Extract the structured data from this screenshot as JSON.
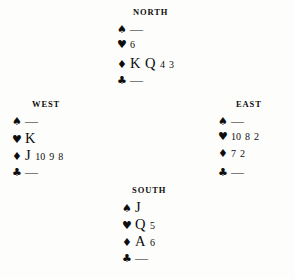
{
  "diagram": {
    "type": "bridge-hand-diagram",
    "background_color": "#fdfdfc",
    "ink_color": "#0d0d0d",
    "suits": {
      "spade": "♠",
      "heart": "♥",
      "diamond": "♦",
      "club": "♣"
    },
    "void_mark": "—"
  },
  "hands": {
    "north": {
      "label": "NORTH",
      "spades": "—",
      "hearts": "6",
      "diamonds": "K Q 4 3",
      "clubs": "—",
      "spade_cards": [
        "—"
      ],
      "heart_cards": [
        "6"
      ],
      "diamond_cards": [
        "K",
        "Q",
        "4",
        "3"
      ],
      "club_cards": [
        "—"
      ]
    },
    "west": {
      "label": "WEST",
      "spades": "—",
      "hearts": "K",
      "diamonds": "J 10 9 8",
      "clubs": "—",
      "spade_cards": [
        "—"
      ],
      "heart_cards": [
        "K"
      ],
      "diamond_cards": [
        "J",
        "10",
        "9",
        "8"
      ],
      "club_cards": [
        "—"
      ]
    },
    "east": {
      "label": "EAST",
      "spades": "—",
      "hearts": "10 8 2",
      "diamonds": "7 2",
      "clubs": "—",
      "spade_cards": [
        "—"
      ],
      "heart_cards": [
        "10",
        "8",
        "2"
      ],
      "diamond_cards": [
        "7",
        "2"
      ],
      "club_cards": [
        "—"
      ]
    },
    "south": {
      "label": "SOUTH",
      "spades": "J",
      "hearts": "Q 5",
      "diamonds": "A 6",
      "clubs": "—",
      "spade_cards": [
        "J"
      ],
      "heart_cards": [
        "Q",
        "5"
      ],
      "diamond_cards": [
        "A",
        "6"
      ],
      "club_cards": [
        "—"
      ]
    }
  }
}
